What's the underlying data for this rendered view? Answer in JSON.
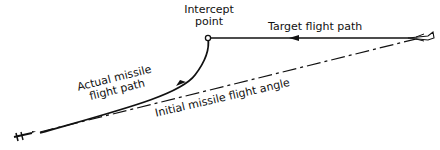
{
  "diagram": {
    "labels": {
      "intercept_line1": "Intercept",
      "intercept_line2": "point",
      "target_path": "Target flight path",
      "actual_line1": "Actual missile",
      "actual_line2": "flight path",
      "initial_angle": "Initial missile flight angle"
    },
    "colors": {
      "ink": "#111111",
      "background": "#ffffff"
    }
  }
}
